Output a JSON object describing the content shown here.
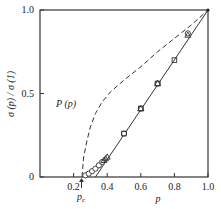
{
  "chart_data": {
    "type": "line",
    "title": "",
    "xlabel": "p",
    "ylabel": "σ (p) / σ (1)",
    "xlim": [
      0,
      1.0
    ],
    "ylim": [
      0,
      1.0
    ],
    "grid": false,
    "x_ticks": [
      "0.2",
      "0.4",
      "0.6",
      "0.8",
      "1.0"
    ],
    "y_ticks": [
      "0",
      "0.5",
      "1.0"
    ],
    "annotations": [
      {
        "text": "P (p)",
        "x": 0.26,
        "y": 0.4
      },
      {
        "text": "p_c",
        "x": 0.25,
        "y": -0.1,
        "marker": "arrow-up"
      }
    ],
    "series": [
      {
        "name": "P (p)",
        "style": "dashed",
        "x": [
          0.25,
          0.26,
          0.28,
          0.3,
          0.33,
          0.37,
          0.42,
          0.5,
          0.6,
          0.7,
          0.8,
          0.9,
          1.0
        ],
        "y": [
          0.0,
          0.12,
          0.22,
          0.3,
          0.38,
          0.45,
          0.51,
          0.58,
          0.66,
          0.75,
          0.83,
          0.91,
          1.0
        ]
      },
      {
        "name": "fit line",
        "style": "solid",
        "x": [
          0.33,
          1.0
        ],
        "y": [
          0.0,
          1.0
        ]
      },
      {
        "name": "circles",
        "marker": "circle",
        "x": [
          0.27,
          0.29,
          0.31,
          0.33,
          0.35,
          0.37,
          0.5,
          0.6,
          0.7,
          0.88
        ],
        "y": [
          0.01,
          0.02,
          0.035,
          0.05,
          0.07,
          0.09,
          0.26,
          0.41,
          0.56,
          0.86
        ]
      },
      {
        "name": "triangles",
        "marker": "triangle",
        "x": [
          0.38,
          0.39,
          0.4,
          0.6,
          0.7,
          0.88
        ],
        "y": [
          0.1,
          0.11,
          0.12,
          0.41,
          0.56,
          0.85
        ]
      },
      {
        "name": "squares",
        "marker": "square",
        "x": [
          0.5,
          0.6,
          0.7,
          0.8
        ],
        "y": [
          0.26,
          0.41,
          0.56,
          0.7
        ]
      }
    ]
  }
}
